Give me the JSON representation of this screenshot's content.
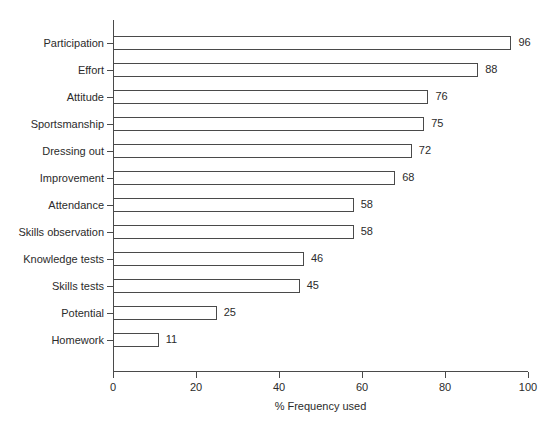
{
  "chart_data": {
    "type": "bar",
    "orientation": "horizontal",
    "title": "",
    "subtitle": "",
    "xlabel": "% Frequency used",
    "ylabel": "",
    "xlim": [
      0,
      100
    ],
    "xticks": [
      0,
      20,
      40,
      60,
      80,
      100
    ],
    "xtick_labels": [
      "0",
      "20",
      "40",
      "60",
      "80",
      "100"
    ],
    "grid": false,
    "legend": false,
    "legend_position": "none",
    "bar_style": {
      "fill": "#ffffff",
      "edge": "#4a4a4a",
      "value_labels": true
    },
    "categories": [
      "Participation",
      "Effort",
      "Attitude",
      "Sportsmanship",
      "Dressing out",
      "Improvement",
      "Attendance",
      "Skills observation",
      "Knowledge tests",
      "Skills tests",
      "Potential",
      "Homework"
    ],
    "values": [
      96,
      88,
      76,
      75,
      72,
      68,
      58,
      58,
      46,
      45,
      25,
      11
    ],
    "value_labels": [
      "96",
      "88",
      "76",
      "75",
      "72",
      "68",
      "58",
      "58",
      "46",
      "45",
      "25",
      "11"
    ],
    "points": [
      {
        "category": "Participation",
        "value": 96,
        "label": "96"
      },
      {
        "category": "Effort",
        "value": 88,
        "label": "88"
      },
      {
        "category": "Attitude",
        "value": 76,
        "label": "76"
      },
      {
        "category": "Sportsmanship",
        "value": 75,
        "label": "75"
      },
      {
        "category": "Dressing out",
        "value": 72,
        "label": "72"
      },
      {
        "category": "Improvement",
        "value": 68,
        "label": "68"
      },
      {
        "category": "Attendance",
        "value": 58,
        "label": "58"
      },
      {
        "category": "Skills observation",
        "value": 58,
        "label": "58"
      },
      {
        "category": "Knowledge tests",
        "value": 46,
        "label": "46"
      },
      {
        "category": "Skills tests",
        "value": 45,
        "label": "45"
      },
      {
        "category": "Potential",
        "value": 25,
        "label": "25"
      },
      {
        "category": "Homework",
        "value": 11,
        "label": "11"
      }
    ]
  },
  "colors": {
    "background": "#ffffff",
    "axis": "#4a4a4a",
    "bar_edge": "#4a4a4a",
    "bar_fill": "#ffffff",
    "text": "#2b2b2b"
  }
}
